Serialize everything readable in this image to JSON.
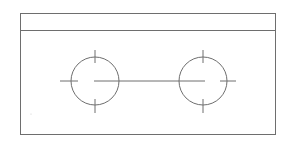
{
  "drawing": {
    "type": "technical-drawing",
    "description": "Rectangular plate with title band and two circular holes with centerlines",
    "stroke_color": "#6e6e6e",
    "background": "#ffffff",
    "outer_rect": {
      "x": 20,
      "y": 13,
      "w": 255,
      "h": 121
    },
    "band_line_y": 30,
    "holes": [
      {
        "cx": 95,
        "cy": 81,
        "r": 24
      },
      {
        "cx": 203,
        "cy": 81,
        "r": 24
      }
    ],
    "connecting_line": {
      "x1": 94,
      "x2": 205,
      "y": 81
    }
  }
}
